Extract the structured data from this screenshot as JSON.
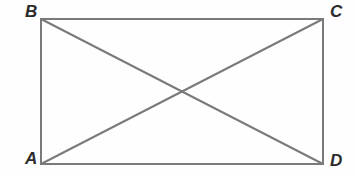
{
  "figure": {
    "type": "geometry-diagram",
    "shape": "rectangle-with-diagonals",
    "background_color": "#fefefe",
    "stroke_color": "#7a7a7a",
    "stroke_width": 2,
    "label_color": "#2b2b2b",
    "vertices": {
      "A": {
        "label": "A",
        "x": 41,
        "y": 164,
        "position": "bottom-left"
      },
      "B": {
        "label": "B",
        "x": 41,
        "y": 19,
        "position": "top-left"
      },
      "C": {
        "label": "C",
        "x": 323,
        "y": 19,
        "position": "top-right"
      },
      "D": {
        "label": "D",
        "x": 323,
        "y": 164,
        "position": "bottom-right"
      }
    },
    "edges": [
      {
        "name": "BC",
        "from": "B",
        "to": "C"
      },
      {
        "name": "CD",
        "from": "C",
        "to": "D"
      },
      {
        "name": "AD",
        "from": "A",
        "to": "D"
      },
      {
        "name": "AB",
        "from": "A",
        "to": "B"
      }
    ],
    "diagonals": [
      {
        "name": "AC",
        "from": "A",
        "to": "C"
      },
      {
        "name": "BD",
        "from": "B",
        "to": "D"
      }
    ],
    "intersection": {
      "name": "diagonal-intersection",
      "x": 182,
      "y": 91
    }
  }
}
